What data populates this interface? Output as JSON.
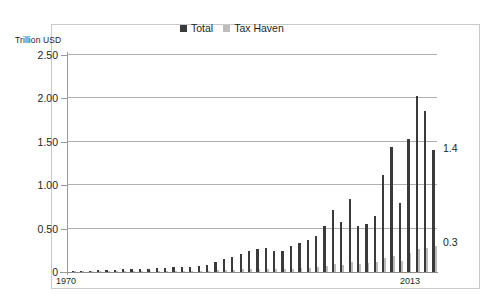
{
  "axis_title": "Trillion USD",
  "legend": [
    {
      "label": "Total",
      "color": "#3a3a3a",
      "name": "legend-total"
    },
    {
      "label": "Tax Haven",
      "color": "#bdbdbd",
      "name": "legend-tax-haven"
    }
  ],
  "annotations": {
    "total_end_label": "1.4",
    "haven_end_label": "0.3"
  },
  "x_axis": {
    "start_label": "1970",
    "end_label": "2013"
  },
  "y_axis": {
    "ticks": [
      "2.50",
      "2.00",
      "1.50",
      "1.00",
      "0.50",
      "0"
    ]
  },
  "chart_data": {
    "type": "bar",
    "title": "",
    "subtitle": "",
    "xlabel": "",
    "ylabel": "Trillion USD",
    "ylim": [
      0,
      2.5
    ],
    "yticks": [
      0,
      0.5,
      1.0,
      1.5,
      2.0,
      2.5
    ],
    "grid": true,
    "legend_position": "top-center",
    "categories": [
      "1970",
      "1971",
      "1972",
      "1973",
      "1974",
      "1975",
      "1976",
      "1977",
      "1978",
      "1979",
      "1980",
      "1981",
      "1982",
      "1983",
      "1984",
      "1985",
      "1986",
      "1987",
      "1988",
      "1989",
      "1990",
      "1991",
      "1992",
      "1993",
      "1994",
      "1995",
      "1996",
      "1997",
      "1998",
      "1999",
      "2000",
      "2001",
      "2002",
      "2003",
      "2004",
      "2005",
      "2006",
      "2007",
      "2008",
      "2009",
      "2010",
      "2011",
      "2012",
      "2013"
    ],
    "series": [
      {
        "name": "Total",
        "color": "#3a3a3a",
        "values": [
          0.01,
          0.01,
          0.01,
          0.02,
          0.02,
          0.02,
          0.03,
          0.03,
          0.04,
          0.04,
          0.05,
          0.05,
          0.06,
          0.06,
          0.06,
          0.07,
          0.08,
          0.12,
          0.15,
          0.17,
          0.21,
          0.24,
          0.26,
          0.28,
          0.24,
          0.24,
          0.3,
          0.34,
          0.37,
          0.42,
          0.53,
          0.72,
          0.58,
          0.84,
          0.53,
          0.55,
          0.65,
          1.12,
          1.44,
          0.8,
          1.53,
          2.03,
          1.85,
          1.4
        ]
      },
      {
        "name": "Tax Haven",
        "color": "#bdbdbd",
        "values": [
          0.0,
          0.0,
          0.0,
          0.0,
          0.0,
          0.0,
          0.0,
          0.0,
          0.01,
          0.01,
          0.01,
          0.01,
          0.01,
          0.01,
          0.01,
          0.01,
          0.01,
          0.02,
          0.02,
          0.02,
          0.03,
          0.03,
          0.03,
          0.04,
          0.03,
          0.03,
          0.04,
          0.05,
          0.05,
          0.06,
          0.07,
          0.09,
          0.08,
          0.11,
          0.09,
          0.1,
          0.12,
          0.16,
          0.19,
          0.13,
          0.22,
          0.27,
          0.28,
          0.3
        ]
      }
    ],
    "end_annotations": [
      {
        "series": "Total",
        "value": 1.4,
        "label": "1.4"
      },
      {
        "series": "Tax Haven",
        "value": 0.3,
        "label": "0.3"
      }
    ]
  }
}
